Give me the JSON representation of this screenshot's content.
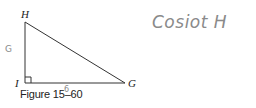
{
  "figure": {
    "caption": "Figure 15–60",
    "vertices": {
      "top": "H",
      "right_angle": "I",
      "right": "G"
    },
    "right_angle_at": "I",
    "sides": {
      "HI": "vertical leg",
      "IG": "horizontal leg",
      "HG": "hypotenuse"
    }
  },
  "annotations": {
    "handwritten_prompt": "Cosiot H",
    "side_mark_left": "G",
    "side_mark_bottom": "6"
  },
  "colors": {
    "line": "#333333",
    "label": "#222222",
    "pencil": "#8a8a8a"
  }
}
